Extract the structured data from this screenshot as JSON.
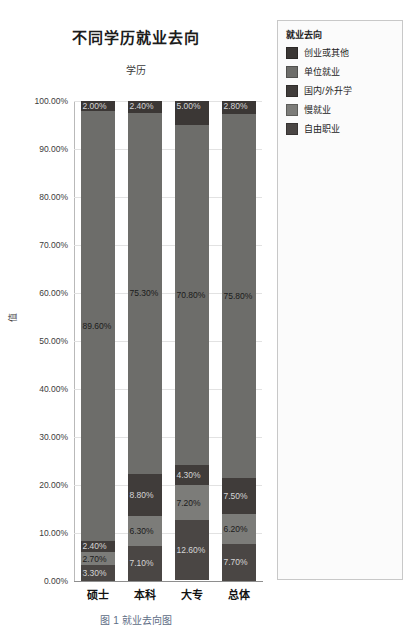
{
  "chart_data": {
    "type": "bar",
    "subtype": "stacked-100-percent",
    "title": "不同学历就业去向",
    "xlabel": "学历",
    "ylabel": "值",
    "categories": [
      "硕士",
      "本科",
      "大专",
      "总体"
    ],
    "ylim": [
      0,
      100
    ],
    "ytick_labels": [
      "100.00%",
      "90.00%",
      "80.00%",
      "70.00%",
      "60.00%",
      "50.00%",
      "40.00%",
      "30.00%",
      "20.00%",
      "10.00%",
      "0.00%"
    ],
    "ytick_values": [
      100,
      90,
      80,
      70,
      60,
      50,
      40,
      30,
      20,
      10,
      0
    ],
    "grid": true,
    "legend_position": "right",
    "legend_title": "就业去向",
    "stack_order_top_to_bottom": [
      "创业或其他",
      "单位就业",
      "国内/外升学",
      "慢就业",
      "自由职业"
    ],
    "series": [
      {
        "name": "创业或其他",
        "color": "#3b3735",
        "values": [
          2.0,
          2.4,
          5.0,
          2.8
        ],
        "labels": [
          "2.00%",
          "2.40%",
          "5.00%",
          "2.80%"
        ]
      },
      {
        "name": "单位就业",
        "color": "#6d6d6a",
        "values": [
          89.6,
          75.3,
          70.8,
          75.8
        ],
        "labels": [
          "89.60%",
          "75.30%",
          "70.80%",
          "75.80%"
        ]
      },
      {
        "name": "国内/外升学",
        "color": "#403c3a",
        "values": [
          2.4,
          8.8,
          4.3,
          7.5
        ],
        "labels": [
          "2.40%",
          "8.80%",
          "4.30%",
          "7.50%"
        ]
      },
      {
        "name": "慢就业",
        "color": "#7c7c79",
        "values": [
          2.7,
          6.3,
          7.2,
          6.2
        ],
        "labels": [
          "2.70%",
          "6.30%",
          "7.20%",
          "6.20%"
        ]
      },
      {
        "name": "自由职业",
        "color": "#4a4644",
        "values": [
          3.3,
          7.1,
          12.6,
          7.7
        ],
        "labels": [
          "3.30%",
          "7.10%",
          "12.60%",
          "7.70%"
        ]
      }
    ]
  },
  "legend": {
    "title": "就业去向",
    "items": [
      {
        "label": "创业或其他",
        "color": "#3b3735"
      },
      {
        "label": "单位就业",
        "color": "#6d6d6a"
      },
      {
        "label": "国内/外升学",
        "color": "#403c3a"
      },
      {
        "label": "慢就业",
        "color": "#7c7c79"
      },
      {
        "label": "自由职业",
        "color": "#4a4644"
      }
    ]
  },
  "bottom_caption": "图 1  就业去向图"
}
